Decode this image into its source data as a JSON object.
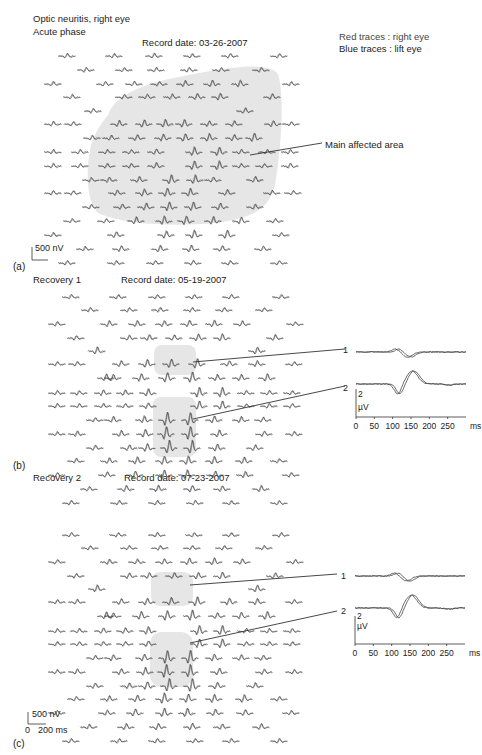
{
  "header": {
    "title_line1": "Optic neuritis, right eye",
    "title_line2": "Acute phase",
    "legend_red": "Red traces : right eye",
    "legend_blue": "Blue traces : lift eye"
  },
  "panels": [
    {
      "letter": "(a)",
      "phase": "",
      "record_date": "Record date: 03-26-2007",
      "annotation": "Main affected area",
      "scale_bar": "500 nV"
    },
    {
      "letter": "(b)",
      "phase": "Recovery 1",
      "record_date": "Record date:  05-19-2007",
      "inset": {
        "trace1_label": "1",
        "trace2_label": "2",
        "y_scale_value": "2",
        "y_scale_unit": "µV",
        "x_ticks": [
          "0",
          "50",
          "100",
          "150",
          "200",
          "250"
        ],
        "x_unit": "ms"
      }
    },
    {
      "letter": "(c)",
      "phase": "Recovery 2",
      "record_date": "Record date: 07-23-2007",
      "inset": {
        "trace1_label": "1",
        "trace2_label": "2",
        "y_scale_value": "2",
        "y_scale_unit": "µV",
        "x_ticks": [
          "0",
          "50",
          "100",
          "150",
          "200",
          "250"
        ],
        "x_unit": "ms"
      },
      "scale_bar_v": "500 nV",
      "scale_bar_t0": "0",
      "scale_bar_t": "200 ms"
    }
  ],
  "colors": {
    "trace": "#444444",
    "shade": "#e6e6e6",
    "text": "#222222"
  },
  "arrays": {
    "a": {
      "origin_y": 56,
      "rows": [
        {
          "dy": 0,
          "xs": [
            58,
            105,
            145,
            183,
            221,
            270
          ],
          "amp": [
            1,
            1,
            1,
            1,
            1,
            1
          ]
        },
        {
          "dy": 14,
          "xs": [
            77,
            115,
            147,
            180,
            212,
            252
          ],
          "amp": [
            1,
            1,
            1,
            1,
            1,
            1
          ]
        },
        {
          "dy": 28,
          "xs": [
            44,
            96,
            125,
            150,
            176,
            203,
            231,
            282
          ],
          "amp": [
            1,
            1,
            1,
            1,
            1.3,
            1.5,
            1.5,
            1
          ]
        },
        {
          "dy": 41,
          "xs": [
            63,
            115,
            138,
            163,
            188,
            211,
            263
          ],
          "amp": [
            1,
            1,
            1.2,
            1.2,
            1.4,
            1.5,
            1.3
          ]
        },
        {
          "dy": 55,
          "xs": [
            84,
            236
          ],
          "amp": [
            1,
            1.3
          ]
        },
        {
          "dy": 55,
          "xs": [],
          "amp": []
        },
        {
          "dy": 68,
          "xs": [
            44,
            64,
            110,
            135,
            156,
            175,
            200,
            225,
            264,
            282
          ],
          "amp": [
            1,
            1,
            1.4,
            1.8,
            1.8,
            1.8,
            1.2,
            1.2,
            1.4,
            1
          ]
        },
        {
          "dy": 82,
          "xs": [
            83,
            102,
            128,
            154,
            176,
            200,
            225,
            245
          ],
          "amp": [
            1,
            1.2,
            1.4,
            1.6,
            1.8,
            1.8,
            1.4,
            2
          ]
        },
        {
          "dy": 96,
          "xs": [
            44,
            71,
            98,
            122,
            147,
            185,
            210,
            232,
            258,
            281
          ],
          "amp": [
            1,
            1,
            1,
            1,
            1.3,
            2,
            2,
            1,
            1,
            1
          ]
        },
        {
          "dy": 110,
          "xs": [
            44,
            71,
            98,
            122,
            147,
            185,
            210,
            232,
            255,
            281
          ],
          "amp": [
            1,
            1,
            1,
            1,
            1.3,
            2,
            2,
            1,
            1,
            1
          ]
        },
        {
          "dy": 124,
          "xs": [
            82,
            100,
            130,
            162,
            186,
            204,
            246
          ],
          "amp": [
            1,
            1.2,
            1.4,
            2,
            2,
            1.2,
            1.4
          ]
        },
        {
          "dy": 137,
          "xs": [
            44,
            64,
            108,
            135,
            158,
            181,
            218,
            263,
            284
          ],
          "amp": [
            1,
            1,
            1.2,
            1.6,
            2,
            1.8,
            1.4,
            1,
            1
          ]
        },
        {
          "dy": 151,
          "xs": [
            82,
            113,
            137,
            160,
            184,
            211,
            246
          ],
          "amp": [
            1,
            1.2,
            1.6,
            2,
            2,
            1.6,
            1.2
          ]
        },
        {
          "dy": 165,
          "xs": [
            63,
            97,
            127,
            155,
            177,
            204,
            232,
            266
          ],
          "amp": [
            1,
            1,
            1.6,
            2,
            2,
            1.8,
            1.5,
            1
          ]
        },
        {
          "dy": 179,
          "xs": [
            44,
            107,
            157,
            185,
            218,
            272
          ],
          "amp": [
            1,
            1.3,
            1.6,
            2,
            2,
            1
          ]
        },
        {
          "dy": 193,
          "xs": [
            76,
            112,
            151,
            182,
            213,
            254
          ],
          "amp": [
            1,
            1.3,
            1.5,
            1.5,
            1.4,
            1.2
          ]
        },
        {
          "dy": 207,
          "xs": [
            58,
            107,
            146,
            184,
            221,
            270
          ],
          "amp": [
            1,
            1,
            1,
            1,
            1,
            1
          ]
        }
      ]
    },
    "b": {
      "origin_y": 297,
      "rows": [
        {
          "dy": 0,
          "xs": [
            62,
            109,
            148,
            185,
            222,
            272
          ],
          "amp": [
            1,
            1,
            1,
            1,
            1,
            1
          ]
        },
        {
          "dy": 13,
          "xs": [
            81,
            120,
            151,
            183,
            215,
            255
          ],
          "amp": [
            1,
            1,
            1,
            1,
            1,
            1
          ]
        },
        {
          "dy": 27,
          "xs": [
            48,
            100,
            128,
            155,
            180,
            205,
            233,
            286
          ],
          "amp": [
            1,
            1.3,
            1.3,
            1.3,
            1.5,
            1.6,
            1.3,
            1
          ]
        },
        {
          "dy": 41,
          "xs": [
            67,
            120,
            140,
            165,
            189,
            213,
            266
          ],
          "amp": [
            1,
            1.3,
            1.3,
            1.3,
            1.5,
            1.6,
            1.3
          ]
        },
        {
          "dy": 54,
          "xs": [
            88,
            248
          ],
          "amp": [
            1.6,
            1.6
          ]
        },
        {
          "dy": 54,
          "xs": [],
          "amp": []
        },
        {
          "dy": 67,
          "xs": [
            48,
            68,
            112,
            138,
            162,
            188,
            220,
            248,
            285
          ],
          "amp": [
            1,
            1,
            1.4,
            1.8,
            2,
            2.2,
            1.2,
            1.3,
            1
          ]
        },
        {
          "dy": 81,
          "xs": [
            97,
            104,
            132,
            158,
            183,
            208,
            232,
            258
          ],
          "amp": [
            1.6,
            1.4,
            1.8,
            2.2,
            2.4,
            1.4,
            1.5,
            1.8
          ]
        },
        {
          "dy": 96,
          "xs": [
            48,
            70,
            94,
            116,
            139,
            190,
            213,
            237,
            260,
            283
          ],
          "amp": [
            1,
            1,
            1.3,
            1.3,
            1.7,
            2.2,
            2.2,
            1,
            1,
            1
          ]
        },
        {
          "dy": 109,
          "xs": [
            48,
            70,
            94,
            116,
            139,
            190,
            213,
            237,
            260,
            283
          ],
          "amp": [
            1,
            1,
            1,
            1,
            1.3,
            2,
            2,
            1,
            1,
            1
          ]
        },
        {
          "dy": 123,
          "xs": [
            86,
            104,
            135,
            158,
            181,
            205,
            232,
            254
          ],
          "amp": [
            1,
            1.4,
            1.6,
            3,
            3,
            1.6,
            1.4,
            1.2
          ]
        },
        {
          "dy": 137,
          "xs": [
            48,
            68,
            112,
            136,
            157,
            181,
            210,
            255,
            285
          ],
          "amp": [
            1,
            1.2,
            1.4,
            1.8,
            3,
            3,
            1.6,
            1.2,
            1
          ]
        },
        {
          "dy": 151,
          "xs": [
            86,
            120,
            138,
            160,
            183,
            208,
            246
          ],
          "amp": [
            1.2,
            1.3,
            1.8,
            3,
            3,
            1.6,
            1.3
          ]
        },
        {
          "dy": 164,
          "xs": [
            67,
            100,
            128,
            155,
            179,
            205,
            235,
            270
          ],
          "amp": [
            1,
            1.3,
            1.6,
            2,
            2,
            1.8,
            1.5,
            1
          ]
        },
        {
          "dy": 178,
          "xs": [
            48,
            98,
            126,
            155,
            178,
            206,
            236,
            282
          ],
          "amp": [
            1,
            1.2,
            1.6,
            2,
            2,
            1.6,
            1.4,
            1
          ]
        },
        {
          "dy": 192,
          "xs": [
            80,
            117,
            149,
            183,
            213,
            252
          ],
          "amp": [
            1,
            1.4,
            1.5,
            1.5,
            1.3,
            1.4
          ]
        },
        {
          "dy": 206,
          "xs": [
            62,
            110,
            148,
            186,
            222,
            270
          ],
          "amp": [
            1,
            1,
            1,
            1,
            1,
            1
          ]
        }
      ]
    },
    "c": {
      "origin_y": 535,
      "rows": [
        {
          "dy": 0,
          "xs": [
            62,
            109,
            148,
            185,
            222,
            272
          ],
          "amp": [
            1,
            1,
            1,
            1,
            1,
            1
          ]
        },
        {
          "dy": 13,
          "xs": [
            81,
            120,
            151,
            183,
            215,
            255
          ],
          "amp": [
            1,
            1,
            1,
            1,
            1,
            1
          ]
        },
        {
          "dy": 27,
          "xs": [
            48,
            100,
            128,
            155,
            180,
            205,
            233,
            286
          ],
          "amp": [
            1,
            1.2,
            1.2,
            1.3,
            1.5,
            1.6,
            1.3,
            1
          ]
        },
        {
          "dy": 41,
          "xs": [
            67,
            120,
            140,
            165,
            189,
            213,
            266
          ],
          "amp": [
            1,
            1.3,
            1.3,
            1.3,
            1.5,
            1.6,
            1.3
          ]
        },
        {
          "dy": 54,
          "xs": [
            88,
            248
          ],
          "amp": [
            1.6,
            1.6
          ]
        },
        {
          "dy": 54,
          "xs": [],
          "amp": []
        },
        {
          "dy": 67,
          "xs": [
            48,
            68,
            112,
            138,
            162,
            188,
            220,
            248,
            285
          ],
          "amp": [
            1,
            1,
            1.4,
            1.6,
            1.8,
            2.2,
            1.6,
            1.3,
            1
          ]
        },
        {
          "dy": 81,
          "xs": [
            97,
            104,
            132,
            158,
            183,
            208,
            232,
            258
          ],
          "amp": [
            1.6,
            1.4,
            1.8,
            2.2,
            2.4,
            1.4,
            1.5,
            1.8
          ]
        },
        {
          "dy": 96,
          "xs": [
            48,
            70,
            94,
            116,
            139,
            190,
            213,
            237,
            260,
            283
          ],
          "amp": [
            1,
            1,
            1.3,
            1.3,
            1.7,
            2.2,
            2.2,
            1,
            1,
            1
          ]
        },
        {
          "dy": 109,
          "xs": [
            48,
            70,
            94,
            116,
            139,
            190,
            213,
            237,
            260,
            283
          ],
          "amp": [
            1,
            1,
            1,
            1,
            1.3,
            2,
            2,
            1,
            1,
            1
          ]
        },
        {
          "dy": 123,
          "xs": [
            86,
            104,
            135,
            158,
            181,
            205,
            232,
            254
          ],
          "amp": [
            1,
            1.4,
            1.6,
            3,
            3,
            1.6,
            1.4,
            1.2
          ]
        },
        {
          "dy": 137,
          "xs": [
            48,
            68,
            112,
            136,
            157,
            181,
            210,
            255,
            285
          ],
          "amp": [
            1,
            1.2,
            1.4,
            1.8,
            3,
            3,
            1.6,
            1.2,
            1
          ]
        },
        {
          "dy": 151,
          "xs": [
            86,
            120,
            138,
            160,
            183,
            208,
            246
          ],
          "amp": [
            1.2,
            1.3,
            1.8,
            3,
            3,
            1.6,
            1.3
          ]
        },
        {
          "dy": 164,
          "xs": [
            67,
            100,
            128,
            155,
            179,
            205,
            235,
            270
          ],
          "amp": [
            1,
            1.3,
            1.6,
            2.4,
            2,
            1.8,
            1.8,
            1
          ]
        },
        {
          "dy": 178,
          "xs": [
            48,
            98,
            126,
            155,
            178,
            206,
            236,
            282
          ],
          "amp": [
            1,
            1.2,
            1.6,
            2,
            2,
            1.6,
            1.4,
            1
          ]
        },
        {
          "dy": 192,
          "xs": [
            80,
            117,
            149,
            183,
            213,
            252
          ],
          "amp": [
            1,
            1.4,
            1.5,
            1.5,
            1.3,
            1.4
          ]
        },
        {
          "dy": 206,
          "xs": [
            62,
            110,
            148,
            186,
            222,
            270
          ],
          "amp": [
            1,
            1,
            1,
            1,
            1,
            1
          ]
        }
      ]
    }
  }
}
